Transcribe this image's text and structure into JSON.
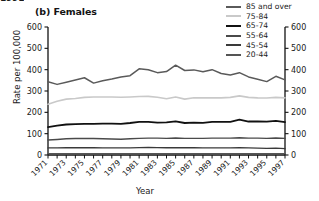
{
  "clipped_header": "1991",
  "panel": {
    "title": "(b) Females"
  },
  "axes": {
    "ylabel": "Rate per 100,000",
    "xlabel": "Year",
    "ytick_labels": [
      "0",
      "100",
      "200",
      "300",
      "400",
      "500",
      "600"
    ],
    "xtick_labels": [
      "1971",
      "1973",
      "1975",
      "1977",
      "1979",
      "1981",
      "1983",
      "1985",
      "1987",
      "1989",
      "1991",
      "1993",
      "1995",
      "1997"
    ]
  },
  "legend": {
    "items": [
      {
        "label": "85 and over",
        "color": "#5a5a5a"
      },
      {
        "label": "75-84",
        "color": "#c9c9c9"
      },
      {
        "label": "65-74",
        "color": "#111111"
      },
      {
        "label": "55-64",
        "color": "#4a4a4a"
      },
      {
        "label": "45-54",
        "color": "#3a3a3a"
      },
      {
        "label": "20-44",
        "color": "#555555"
      }
    ]
  },
  "chart_data": {
    "type": "line",
    "title": "(b) Females",
    "xlabel": "Year",
    "ylabel": "Rate per 100,000",
    "xlim": [
      1971,
      1997
    ],
    "ylim": [
      0,
      600
    ],
    "ytick_interval": 100,
    "xtick_interval": 2,
    "grid": false,
    "legend_position": "top-right",
    "x": [
      1971,
      1972,
      1973,
      1974,
      1975,
      1976,
      1977,
      1978,
      1979,
      1980,
      1981,
      1982,
      1983,
      1984,
      1985,
      1986,
      1987,
      1988,
      1989,
      1990,
      1991,
      1992,
      1993,
      1994,
      1995,
      1996,
      1997
    ],
    "series": [
      {
        "name": "85 and over",
        "color": "#5a5a5a",
        "width": 1.5,
        "values": [
          343,
          331,
          341,
          352,
          362,
          337,
          348,
          356,
          366,
          372,
          404,
          400,
          386,
          391,
          421,
          396,
          399,
          390,
          400,
          382,
          375,
          386,
          366,
          355,
          344,
          369,
          352
        ]
      },
      {
        "name": "75-84",
        "color": "#c9c9c9",
        "width": 1.6,
        "values": [
          238,
          252,
          262,
          265,
          270,
          272,
          272,
          272,
          271,
          272,
          274,
          275,
          271,
          264,
          272,
          262,
          268,
          268,
          268,
          268,
          270,
          277,
          270,
          268,
          267,
          270,
          268
        ]
      },
      {
        "name": "65-74",
        "color": "#111111",
        "width": 1.8,
        "values": [
          131,
          138,
          143,
          145,
          146,
          146,
          147,
          147,
          146,
          150,
          155,
          155,
          152,
          153,
          158,
          150,
          152,
          151,
          155,
          155,
          155,
          166,
          157,
          158,
          156,
          160,
          154
        ]
      },
      {
        "name": "55-64",
        "color": "#4a4a4a",
        "width": 1.4,
        "values": [
          70,
          73,
          76,
          77,
          78,
          77,
          76,
          75,
          74,
          76,
          78,
          79,
          79,
          78,
          80,
          78,
          78,
          78,
          79,
          79,
          79,
          81,
          79,
          79,
          78,
          80,
          78
        ]
      },
      {
        "name": "45-54",
        "color": "#3a3a3a",
        "width": 1.3,
        "values": [
          33,
          33,
          34,
          34,
          34,
          34,
          33,
          33,
          33,
          33,
          35,
          36,
          35,
          34,
          35,
          34,
          34,
          33,
          33,
          33,
          33,
          34,
          33,
          32,
          31,
          32,
          30
        ]
      },
      {
        "name": "20-44",
        "color": "#555555",
        "width": 1.2,
        "values": [
          6,
          6,
          6,
          6,
          6,
          6,
          6,
          6,
          6,
          6,
          6,
          6,
          6,
          6,
          6,
          6,
          6,
          6,
          6,
          6,
          6,
          6,
          6,
          6,
          6,
          6,
          6
        ]
      }
    ]
  }
}
